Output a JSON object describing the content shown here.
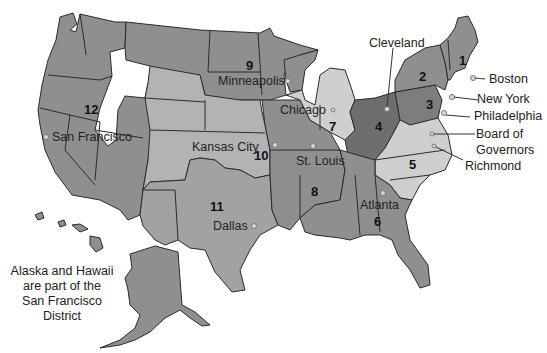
{
  "colors": {
    "dark": "#6e6e6e",
    "medium": "#8f8f8f",
    "light": "#b3b3b3",
    "lighter": "#cfcfcf",
    "border": "#2b2b2b",
    "background": "#ffffff",
    "city_dot": "#d9d9d9"
  },
  "districts": [
    {
      "number": "1",
      "bank_city": "Boston"
    },
    {
      "number": "2",
      "bank_city": "New York"
    },
    {
      "number": "3",
      "bank_city": "Philadelphia"
    },
    {
      "number": "4",
      "bank_city": "Cleveland"
    },
    {
      "number": "5",
      "bank_city": "Richmond"
    },
    {
      "number": "6",
      "bank_city": "Atlanta"
    },
    {
      "number": "7",
      "bank_city": "Chicago"
    },
    {
      "number": "8",
      "bank_city": "St. Louis"
    },
    {
      "number": "9",
      "bank_city": "Minneapolis"
    },
    {
      "number": "10",
      "bank_city": "Kansas City"
    },
    {
      "number": "11",
      "bank_city": "Dallas"
    },
    {
      "number": "12",
      "bank_city": "San Francisco"
    }
  ],
  "labels": {
    "board": "Board of\nGovernors",
    "board_line1": "Board of",
    "board_line2": "Governors",
    "note_line1": "Alaska and Hawaii",
    "note_line2": "are part of the",
    "note_line3": "San Francisco District"
  }
}
